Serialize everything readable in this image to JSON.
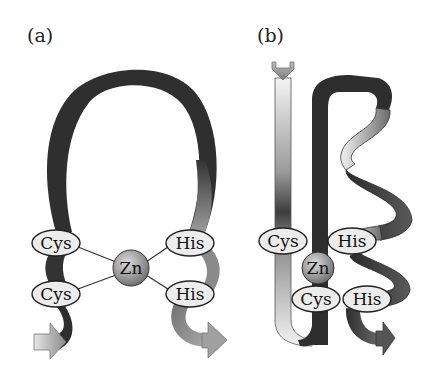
{
  "figure": {
    "panels": [
      {
        "id": "a",
        "label": "(a)",
        "residues": {
          "cys_top": "Cys",
          "cys_bottom": "Cys",
          "his_top": "His",
          "his_bottom": "His"
        },
        "metal": "Zn"
      },
      {
        "id": "b",
        "label": "(b)",
        "residues": {
          "cys_top": "Cys",
          "cys_bottom": "Cys",
          "his_top": "His",
          "his_bottom": "His"
        },
        "metal": "Zn"
      }
    ],
    "colors": {
      "ribbon_dark": "#2e2e2e",
      "ribbon_mid": "#7a7a7a",
      "ribbon_light": "#e8e8e8",
      "label_fill": "#ececec",
      "sphere": "#9a9a9a",
      "background": "#ffffff"
    }
  }
}
